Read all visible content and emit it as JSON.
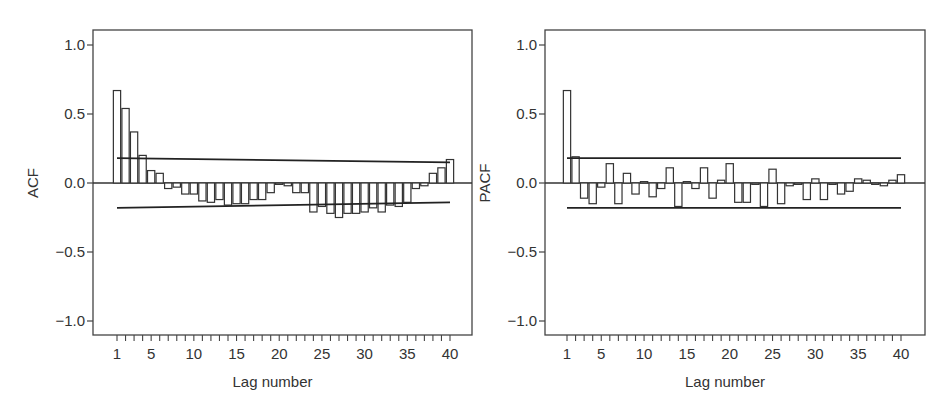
{
  "chart_data": [
    {
      "type": "bar",
      "panel": "left",
      "title": "",
      "xlabel": "Lag number",
      "ylabel": "ACF",
      "ylim": [
        -1.0,
        1.0
      ],
      "yticks": [
        "1.0",
        "0.5",
        "0.0",
        "-0.5",
        "-1.0"
      ],
      "ytick_values": [
        1.0,
        0.5,
        0.0,
        -0.5,
        -1.0
      ],
      "xtick_labels": [
        "1",
        "5",
        "10",
        "15",
        "20",
        "25",
        "30",
        "35",
        "40"
      ],
      "xtick_values": [
        1,
        5,
        10,
        15,
        20,
        25,
        30,
        35,
        40
      ],
      "grid": false,
      "x": [
        1,
        2,
        3,
        4,
        5,
        6,
        7,
        8,
        9,
        10,
        11,
        12,
        13,
        14,
        15,
        16,
        17,
        18,
        19,
        20,
        21,
        22,
        23,
        24,
        25,
        26,
        27,
        28,
        29,
        30,
        31,
        32,
        33,
        34,
        35,
        36,
        37,
        38,
        39,
        40
      ],
      "values": [
        0.67,
        0.54,
        0.37,
        0.2,
        0.09,
        0.07,
        -0.04,
        -0.03,
        -0.08,
        -0.08,
        -0.13,
        -0.14,
        -0.12,
        -0.16,
        -0.15,
        -0.15,
        -0.12,
        -0.12,
        -0.07,
        -0.01,
        -0.02,
        -0.07,
        -0.07,
        -0.21,
        -0.17,
        -0.22,
        -0.25,
        -0.22,
        -0.22,
        -0.21,
        -0.18,
        -0.21,
        -0.16,
        -0.17,
        -0.14,
        -0.04,
        -0.02,
        0.07,
        0.11,
        0.17
      ],
      "confidence_bounds": {
        "upper": {
          "start": 0.18,
          "end": 0.15
        },
        "lower": {
          "start": -0.18,
          "end": -0.14
        }
      }
    },
    {
      "type": "bar",
      "panel": "right",
      "title": "",
      "xlabel": "Lag number",
      "ylabel": "PACF",
      "ylim": [
        -1.0,
        1.0
      ],
      "yticks": [
        "1.0",
        "0.5",
        "0.0",
        "-0.5",
        "-1.0"
      ],
      "ytick_values": [
        1.0,
        0.5,
        0.0,
        -0.5,
        -1.0
      ],
      "xtick_labels": [
        "1",
        "5",
        "10",
        "15",
        "20",
        "25",
        "30",
        "35",
        "40"
      ],
      "xtick_values": [
        1,
        5,
        10,
        15,
        20,
        25,
        30,
        35,
        40
      ],
      "grid": false,
      "x": [
        1,
        2,
        3,
        4,
        5,
        6,
        7,
        8,
        9,
        10,
        11,
        12,
        13,
        14,
        15,
        16,
        17,
        18,
        19,
        20,
        21,
        22,
        23,
        24,
        25,
        26,
        27,
        28,
        29,
        30,
        31,
        32,
        33,
        34,
        35,
        36,
        37,
        38,
        39,
        40
      ],
      "values": [
        0.67,
        0.19,
        -0.11,
        -0.15,
        -0.03,
        0.14,
        -0.15,
        0.07,
        -0.08,
        0.01,
        -0.1,
        -0.04,
        0.11,
        -0.17,
        0.01,
        -0.04,
        0.11,
        -0.11,
        0.02,
        0.14,
        -0.14,
        -0.14,
        -0.01,
        -0.17,
        0.1,
        -0.15,
        -0.02,
        -0.01,
        -0.12,
        0.03,
        -0.12,
        -0.01,
        -0.08,
        -0.06,
        0.03,
        0.02,
        -0.01,
        -0.02,
        0.02,
        0.06
      ],
      "confidence_bounds": {
        "upper": {
          "start": 0.18,
          "end": 0.18
        },
        "lower": {
          "start": -0.18,
          "end": -0.18
        }
      }
    }
  ],
  "panels": [
    {
      "ylabel": "ACF",
      "xlabel": "Lag number"
    },
    {
      "ylabel": "PACF",
      "xlabel": "Lag number"
    }
  ]
}
